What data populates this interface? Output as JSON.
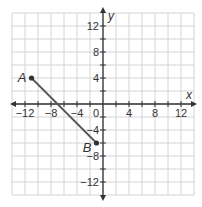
{
  "graph": {
    "x_axis_label": "x",
    "y_axis_label": "y",
    "x_range": [
      -14,
      14
    ],
    "y_range": [
      -14,
      14
    ],
    "grid_step": 2,
    "x_tick_labels": [
      {
        "value": -12,
        "text": "−12"
      },
      {
        "value": -8,
        "text": "−8"
      },
      {
        "value": -4,
        "text": "−4"
      },
      {
        "value": 4,
        "text": "4"
      },
      {
        "value": 8,
        "text": "8"
      },
      {
        "value": 12,
        "text": "12"
      }
    ],
    "y_tick_labels": [
      {
        "value": 12,
        "text": "12"
      },
      {
        "value": 8,
        "text": "8"
      },
      {
        "value": 4,
        "text": "4"
      },
      {
        "value": -4,
        "text": "−4"
      },
      {
        "value": -8,
        "text": "−8"
      },
      {
        "value": -12,
        "text": "−12"
      }
    ],
    "origin_label": "0",
    "points": [
      {
        "label": "A",
        "x": -11,
        "y": 4
      },
      {
        "label": "B",
        "x": -1,
        "y": -6
      }
    ],
    "segment": {
      "from": "A",
      "to": "B"
    },
    "colors": {
      "grid": "#d4d4d4",
      "axis": "#333333",
      "segment": "#555555",
      "point": "#333333",
      "text": "#333333"
    }
  }
}
